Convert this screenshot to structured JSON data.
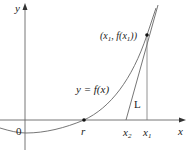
{
  "figure": {
    "labels": {
      "y_axis": "y",
      "x_axis": "x",
      "origin": "0",
      "root": "r",
      "x1": "x",
      "x1_sub": "1",
      "x2": "x",
      "x2_sub": "2",
      "curve": "y = f(x)",
      "tangent": "L",
      "point_open": "(x",
      "point_sub1": "1",
      "point_mid": ", f(x",
      "point_sub2": "1",
      "point_close": "))"
    },
    "colors": {
      "axis": "#555555",
      "curve": "#555555",
      "tangent": "#555555",
      "point": "#111111",
      "text": "#222222"
    }
  }
}
